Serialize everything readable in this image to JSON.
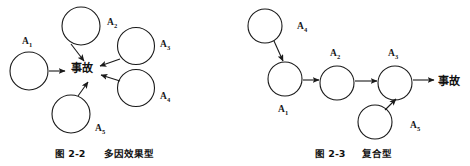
{
  "figure_left": {
    "id": "fig-2-2",
    "caption_number": "图 2-2",
    "caption_title": "多因效果型",
    "center_label": "事故",
    "nodes": [
      {
        "key": "A1",
        "label": "A",
        "sub": "1",
        "cx": 29,
        "cy": 71,
        "r": 19,
        "label_x": 22,
        "label_y": 44
      },
      {
        "key": "A2",
        "label": "A",
        "sub": "2",
        "cx": 81,
        "cy": 26,
        "r": 19,
        "label_x": 107,
        "label_y": 25
      },
      {
        "key": "A3",
        "label": "A",
        "sub": "3",
        "cx": 136,
        "cy": 46,
        "r": 18.5,
        "label_x": 160,
        "label_y": 47
      },
      {
        "key": "A4",
        "label": "A",
        "sub": "4",
        "cx": 136,
        "cy": 88,
        "r": 18.5,
        "label_x": 160,
        "label_y": 99
      },
      {
        "key": "A5",
        "label": "A",
        "sub": "5",
        "cx": 71,
        "cy": 114,
        "r": 19,
        "label_x": 95,
        "label_y": 131
      }
    ],
    "edges": [
      {
        "from": "A1",
        "to": "center",
        "x1": 49,
        "y1": 71,
        "x2": 65,
        "y2": 71
      },
      {
        "from": "A2",
        "to": "center",
        "x1": 71,
        "y1": 44,
        "x2": 84,
        "y2": 61
      },
      {
        "from": "A3",
        "to": "center",
        "x1": 120,
        "y1": 59,
        "x2": 100,
        "y2": 66
      },
      {
        "from": "A4",
        "to": "center",
        "x1": 120,
        "y1": 81,
        "x2": 101,
        "y2": 75
      },
      {
        "from": "A5",
        "to": "center",
        "x1": 78,
        "y1": 96,
        "x2": 88,
        "y2": 82
      }
    ],
    "center_x": 82,
    "center_y": 72
  },
  "figure_right": {
    "id": "fig-2-3",
    "caption_number": "图 2-3",
    "caption_title": "复合型",
    "outcome_label": "事故",
    "nodes": [
      {
        "key": "A4",
        "label": "A",
        "sub": "4",
        "cx": 265,
        "cy": 26,
        "r": 17,
        "label_x": 297,
        "label_y": 29
      },
      {
        "key": "A1",
        "label": "A",
        "sub": "1",
        "cx": 285,
        "cy": 79,
        "r": 17,
        "label_x": 278,
        "label_y": 112
      },
      {
        "key": "A2",
        "label": "A",
        "sub": "2",
        "cx": 337,
        "cy": 83,
        "r": 17,
        "label_x": 330,
        "label_y": 56
      },
      {
        "key": "A3",
        "label": "A",
        "sub": "3",
        "cx": 395,
        "cy": 83,
        "r": 17,
        "label_x": 388,
        "label_y": 56
      },
      {
        "key": "A5",
        "label": "A",
        "sub": "5",
        "cx": 375,
        "cy": 122,
        "r": 17,
        "label_x": 410,
        "label_y": 128
      }
    ],
    "edges": [
      {
        "from": "A4",
        "to": "A1",
        "x1": 274,
        "y1": 41,
        "x2": 283,
        "y2": 61
      },
      {
        "from": "A1",
        "to": "A2",
        "x1": 303,
        "y1": 80,
        "x2": 319,
        "y2": 80
      },
      {
        "from": "A2",
        "to": "A3",
        "x1": 355,
        "y1": 81,
        "x2": 377,
        "y2": 81
      },
      {
        "from": "A5",
        "to": "A3",
        "x1": 385,
        "y1": 110,
        "x2": 396,
        "y2": 99
      },
      {
        "from": "A3",
        "to": "outcome",
        "x1": 413,
        "y1": 80,
        "x2": 434,
        "y2": 80
      }
    ],
    "outcome_x": 438,
    "outcome_y": 85
  }
}
